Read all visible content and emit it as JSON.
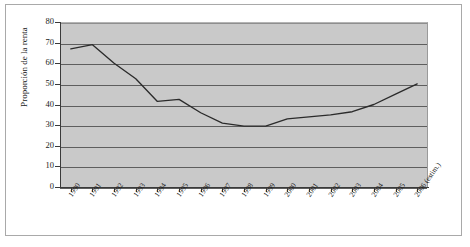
{
  "chart_data": {
    "type": "line",
    "title": "",
    "xlabel": "",
    "ylabel": "Proporción de la renta",
    "ylim": [
      0,
      80
    ],
    "yticks": [
      0,
      10,
      20,
      30,
      40,
      50,
      60,
      70,
      80
    ],
    "grid": true,
    "legend": "none",
    "categories": [
      "1990",
      "1991",
      "1992",
      "1993",
      "1994",
      "1995",
      "1996",
      "1997",
      "1998",
      "1999",
      "2000",
      "2001",
      "2002",
      "2003",
      "2004",
      "2005",
      "2006 (estim.)"
    ],
    "series": [
      {
        "name": "Proporción de la renta",
        "values": [
          67,
          69,
          60,
          52.5,
          41.5,
          42.5,
          36,
          31,
          29.5,
          29.5,
          33,
          34,
          35,
          36.5,
          40,
          45,
          50
        ]
      }
    ],
    "colors": {
      "panel": "#c9c9c9",
      "gridline": "#5e5e5e",
      "axis": "#3a3a3a",
      "line": "#2b2b2b",
      "frame": "#a9a9a9",
      "background": "#ffffff",
      "text": "#1a1a1a"
    }
  }
}
